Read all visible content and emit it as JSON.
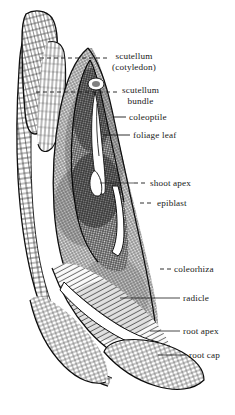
{
  "figure": {
    "background_color": "#ffffff",
    "ink_color": "#1a1a1a",
    "width": 235,
    "height": 415
  },
  "labels": [
    {
      "id": "scutellum",
      "name": "label-scutellum",
      "line1": "scutellum",
      "line2": "(cotyledon)",
      "x": 112,
      "y": 51,
      "leader": {
        "style": "dashed",
        "x1": 40,
        "y1": 58,
        "x2": 109,
        "y2": 58
      }
    },
    {
      "id": "scutellum-bundle",
      "name": "label-scutellum-bundle",
      "line1": "scutellum",
      "line2": "bundle",
      "x": 122,
      "y": 85,
      "leader": {
        "style": "dashed",
        "x1": 36,
        "y1": 92,
        "x2": 118,
        "y2": 92
      }
    },
    {
      "id": "coleoptile",
      "name": "label-coleoptile",
      "line1": "coleoptile",
      "line2": "",
      "x": 129,
      "y": 112,
      "leader": {
        "style": "solid",
        "x1": 113,
        "y1": 117,
        "x2": 126,
        "y2": 117
      }
    },
    {
      "id": "foliage-leaf",
      "name": "label-foliage-leaf",
      "line1": "foliage leaf",
      "line2": "",
      "x": 133,
      "y": 130,
      "leader": {
        "style": "solid",
        "x1": 103,
        "y1": 135,
        "x2": 130,
        "y2": 135
      }
    },
    {
      "id": "shoot-apex",
      "name": "label-shoot-apex",
      "line1": "shoot apex",
      "line2": "",
      "x": 150,
      "y": 178,
      "leader": {
        "style": "dashed",
        "x1": 134,
        "y1": 183,
        "x2": 147,
        "y2": 183
      }
    },
    {
      "id": "epiblast",
      "name": "label-epiblast",
      "line1": "epiblast",
      "line2": "",
      "x": 157,
      "y": 198,
      "leader": {
        "style": "dashed",
        "x1": 140,
        "y1": 203,
        "x2": 154,
        "y2": 203
      }
    },
    {
      "id": "coleorhiza",
      "name": "label-coleorhiza",
      "line1": "coleorhiza",
      "line2": "",
      "x": 174,
      "y": 264,
      "leader": {
        "style": "dashed",
        "x1": 160,
        "y1": 269,
        "x2": 171,
        "y2": 269
      }
    },
    {
      "id": "radicle",
      "name": "label-radicle",
      "line1": "radicle",
      "line2": "",
      "x": 183,
      "y": 293,
      "leader": {
        "style": "solid",
        "x1": 168,
        "y1": 298,
        "x2": 180,
        "y2": 298
      }
    },
    {
      "id": "root-apex",
      "name": "label-root-apex",
      "line1": "root apex",
      "line2": "",
      "x": 183,
      "y": 326,
      "leader": {
        "style": "solid",
        "x1": 168,
        "y1": 331,
        "x2": 180,
        "y2": 331
      }
    },
    {
      "id": "root-cap",
      "name": "label-root-cap",
      "line1": "root cap",
      "line2": "",
      "x": 189,
      "y": 350,
      "leader": {
        "style": "solid",
        "x1": 174,
        "y1": 355,
        "x2": 186,
        "y2": 355
      }
    }
  ],
  "structures": [
    {
      "id": "pericarp-seed-coat",
      "name": "structure-pericarp",
      "note": "outer layered wall at left"
    },
    {
      "id": "scutellum-body",
      "name": "structure-scutellum",
      "note": "large parenchyma mass"
    },
    {
      "id": "embryo-axis",
      "name": "structure-embryo-axis",
      "note": "central darker shoot-root axis"
    },
    {
      "id": "coleoptile-sheath",
      "name": "structure-coleoptile",
      "note": "pointed sheath over shoot apex"
    },
    {
      "id": "coleorhiza-sheath",
      "name": "structure-coleorhiza",
      "note": "sheath over radicle"
    },
    {
      "id": "root-cap-tip",
      "name": "structure-root-cap",
      "note": "cap of cells at root tip"
    }
  ]
}
